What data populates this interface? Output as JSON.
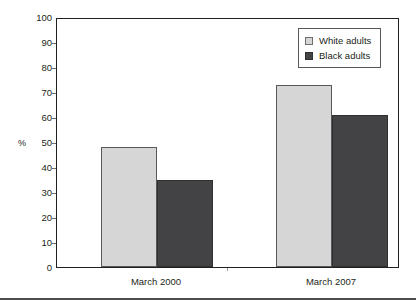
{
  "chart_data": {
    "type": "bar",
    "title": "",
    "xlabel": "",
    "ylabel": "%",
    "ylim": [
      0,
      100
    ],
    "ytick_step": 10,
    "yticks": [
      100,
      90,
      80,
      70,
      60,
      50,
      40,
      30,
      20,
      10,
      0
    ],
    "categories": [
      "March 2000",
      "March 2007"
    ],
    "grid": false,
    "legend_position": "top-right",
    "series": [
      {
        "name": "White adults",
        "color": "#d6d6d6",
        "values": [
          48,
          73
        ]
      },
      {
        "name": "Black adults",
        "color": "#434345",
        "values": [
          35,
          61
        ]
      }
    ]
  },
  "axis": {
    "y_title": "%",
    "y_tick_labels": [
      "100",
      "90",
      "80",
      "70",
      "60",
      "50",
      "40",
      "30",
      "20",
      "10",
      "0"
    ],
    "x_tick_labels": [
      "March 2000",
      "March 2007"
    ]
  },
  "legend": {
    "items": [
      {
        "label": "White adults",
        "swatch": "white-adults-swatch"
      },
      {
        "label": "Black adults",
        "swatch": "black-adults-swatch"
      }
    ]
  },
  "colors": {
    "white_adults_fill": "#d6d6d6",
    "black_adults_fill": "#434345",
    "frame": "#231f20",
    "text": "#231f20",
    "bottom_rule": "#4d4d4f"
  }
}
